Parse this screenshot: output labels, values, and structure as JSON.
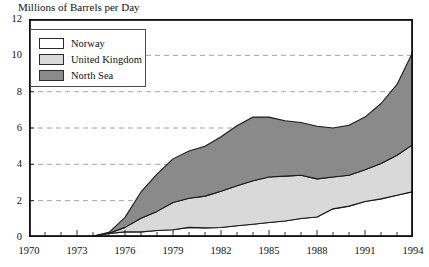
{
  "chart_data": {
    "type": "area",
    "stacked": true,
    "title": "Millions of Barrels per Day",
    "xlabel": "",
    "ylabel": "",
    "xlim": [
      1970,
      1994
    ],
    "ylim": [
      0,
      12
    ],
    "ytick_values": [
      0,
      2,
      4,
      6,
      8,
      10,
      12
    ],
    "ytick_labels": [
      "0",
      "2",
      "4",
      "6",
      "8",
      "10",
      "12"
    ],
    "xtick_labels": [
      "1970",
      "1973",
      "1976",
      "1979",
      "1982",
      "1985",
      "1988",
      "1991",
      "1994"
    ],
    "xtick_label_values": [
      1970,
      1973,
      1976,
      1979,
      1982,
      1985,
      1988,
      1991,
      1994
    ],
    "minor_xticks_every": 1,
    "grid": "horizontal-dashed",
    "legend_position": "upper-left-inside",
    "x": [
      1970,
      1971,
      1972,
      1973,
      1974,
      1975,
      1976,
      1977,
      1978,
      1979,
      1980,
      1981,
      1982,
      1983,
      1984,
      1985,
      1986,
      1987,
      1988,
      1989,
      1990,
      1991,
      1992,
      1993,
      1994
    ],
    "series": [
      {
        "name": "Norway",
        "color": "#ffffff",
        "values": [
          0.0,
          0.0,
          0.0,
          0.0,
          0.04,
          0.19,
          0.28,
          0.28,
          0.36,
          0.4,
          0.53,
          0.5,
          0.52,
          0.62,
          0.7,
          0.8,
          0.88,
          1.02,
          1.1,
          1.55,
          1.7,
          1.95,
          2.1,
          2.3,
          2.5
        ]
      },
      {
        "name": "United Kingdom",
        "color": "#d9d9d9",
        "values": [
          0.0,
          0.0,
          0.0,
          0.0,
          0.0,
          0.02,
          0.25,
          0.75,
          1.05,
          1.5,
          1.6,
          1.75,
          2.0,
          2.2,
          2.4,
          2.5,
          2.47,
          2.38,
          2.1,
          1.75,
          1.7,
          1.75,
          1.95,
          2.2,
          2.6
        ]
      },
      {
        "name": "North Sea",
        "color": "#8a8a8a",
        "values": [
          0.0,
          0.0,
          0.0,
          0.0,
          0.01,
          0.05,
          0.55,
          1.45,
          2.05,
          2.4,
          2.6,
          2.75,
          3.0,
          3.3,
          3.5,
          3.3,
          3.05,
          2.9,
          2.9,
          2.7,
          2.75,
          2.9,
          3.3,
          3.9,
          5.1
        ]
      }
    ],
    "totals": [
      0.0,
      0.0,
      0.0,
      0.0,
      0.05,
      0.26,
      1.08,
      2.48,
      3.46,
      4.3,
      4.73,
      5.0,
      5.52,
      6.12,
      6.6,
      6.6,
      6.4,
      6.3,
      6.1,
      6.0,
      6.15,
      6.6,
      7.35,
      8.4,
      10.2
    ]
  },
  "legend": {
    "items": [
      {
        "label": "Norway",
        "color": "#ffffff"
      },
      {
        "label": "United Kingdom",
        "color": "#d9d9d9"
      },
      {
        "label": "North Sea",
        "color": "#8a8a8a"
      }
    ]
  }
}
